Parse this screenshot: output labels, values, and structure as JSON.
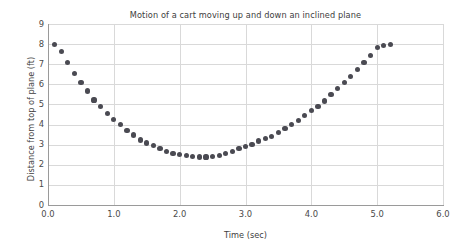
{
  "chart_data": {
    "type": "scatter",
    "title": "Motion of a cart moving up and down an inclined plane",
    "xlabel": "Time (sec)",
    "ylabel": "Distance from top of plane (ft)",
    "xlim": [
      0.0,
      6.0
    ],
    "ylim": [
      0,
      9
    ],
    "xticks": [
      "0.0",
      "1.0",
      "2.0",
      "3.0",
      "4.0",
      "5.0",
      "6.0"
    ],
    "xtick_values": [
      0.0,
      1.0,
      2.0,
      3.0,
      4.0,
      5.0,
      6.0
    ],
    "yticks": [
      "0",
      "1",
      "2",
      "3",
      "4",
      "5",
      "6",
      "7",
      "8",
      "9"
    ],
    "ytick_values": [
      0,
      1,
      2,
      3,
      4,
      5,
      6,
      7,
      8,
      9
    ],
    "grid": true,
    "legend": "none",
    "marker_color": "#4a4a52",
    "marker_shape": "circle",
    "x": [
      0.1,
      0.2,
      0.3,
      0.4,
      0.5,
      0.6,
      0.7,
      0.8,
      0.9,
      1.0,
      1.1,
      1.2,
      1.3,
      1.4,
      1.5,
      1.6,
      1.7,
      1.8,
      1.9,
      2.0,
      2.1,
      2.2,
      2.3,
      2.4,
      2.5,
      2.6,
      2.7,
      2.8,
      2.9,
      3.0,
      3.1,
      3.2,
      3.3,
      3.4,
      3.5,
      3.6,
      3.7,
      3.8,
      3.9,
      4.0,
      4.1,
      4.2,
      4.3,
      4.4,
      4.5,
      4.6,
      4.7,
      4.8,
      4.9,
      5.0,
      5.1,
      5.2
    ],
    "y": [
      8.0,
      7.65,
      7.1,
      6.55,
      6.1,
      5.67,
      5.22,
      4.88,
      4.55,
      4.25,
      4.02,
      3.72,
      3.48,
      3.23,
      3.08,
      2.95,
      2.8,
      2.68,
      2.58,
      2.5,
      2.45,
      2.41,
      2.39,
      2.39,
      2.42,
      2.47,
      2.55,
      2.65,
      2.8,
      2.92,
      3.02,
      3.18,
      3.3,
      3.42,
      3.6,
      3.8,
      4.0,
      4.2,
      4.45,
      4.68,
      4.9,
      5.17,
      5.5,
      5.78,
      6.08,
      6.38,
      6.72,
      7.08,
      7.42,
      7.82,
      7.95,
      8.0
    ]
  }
}
